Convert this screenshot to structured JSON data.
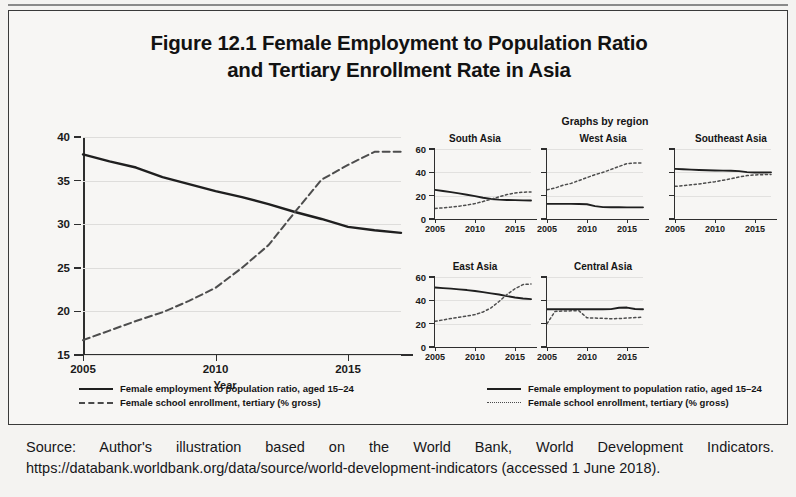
{
  "figure": {
    "title_line1": "Figure 12.1  Female Employment to Population Ratio",
    "title_line2": "and Tertiary Enrollment Rate in Asia"
  },
  "source": {
    "line1": "Source: Author's illustration based on the World Bank, World Development Indicators.",
    "line2": "https://databank.worldbank.org/data/source/world-development-indicators (accessed 1 June 2018)."
  },
  "legend_left": {
    "series": [
      {
        "label": "Female employment to population ratio, aged 15–24",
        "style": "solid"
      },
      {
        "label": "Female school enrollment, tertiary (% gross)",
        "style": "dashed"
      }
    ]
  },
  "legend_right": {
    "series": [
      {
        "label": "Female employment to population ratio, aged 15–24",
        "style": "solid"
      },
      {
        "label": "Female school enrollment, tertiary (% gross)",
        "style": "dotted"
      }
    ]
  },
  "smalls_header": "Graphs by region",
  "axis_titles": {
    "main_x": "Year",
    "smalls_x_left": "Year",
    "smalls_x_right": "Year"
  },
  "chart_data": [
    {
      "id": "main",
      "type": "line",
      "title": "",
      "xlabel": "Year",
      "ylabel": "",
      "xlim": [
        2005,
        2017
      ],
      "ylim": [
        15,
        40
      ],
      "xticks": [
        2005,
        2010,
        2015
      ],
      "yticks": [
        15,
        20,
        25,
        30,
        35,
        40
      ],
      "grid": true,
      "legend_position": "below",
      "x": [
        2005,
        2006,
        2007,
        2008,
        2009,
        2010,
        2011,
        2012,
        2013,
        2014,
        2015,
        2016,
        2017
      ],
      "series": [
        {
          "name": "Female employment to population ratio, aged 15-24",
          "style": "solid",
          "values": [
            38.0,
            37.2,
            36.5,
            35.4,
            34.6,
            33.8,
            33.1,
            32.3,
            31.4,
            30.6,
            29.7,
            29.3,
            29.0
          ]
        },
        {
          "name": "Female school enrollment, tertiary (% gross)",
          "style": "dashed",
          "values": [
            16.7,
            17.8,
            18.9,
            19.9,
            21.2,
            22.7,
            25.0,
            27.6,
            31.4,
            35.1,
            36.8,
            38.3,
            38.3
          ]
        }
      ]
    },
    {
      "id": "south-asia",
      "type": "line",
      "title": "South Asia",
      "xlabel": "Year",
      "ylabel": "",
      "xlim": [
        2005,
        2017
      ],
      "ylim": [
        0,
        60
      ],
      "xticks": [
        2005,
        2010,
        2015
      ],
      "yticks": [
        0,
        20,
        40,
        60
      ],
      "grid": true,
      "x": [
        2005,
        2006,
        2007,
        2008,
        2009,
        2010,
        2011,
        2012,
        2013,
        2014,
        2015,
        2016,
        2017
      ],
      "series": [
        {
          "name": "Female employment to population ratio, aged 15-24",
          "style": "solid",
          "values": [
            25.0,
            24.0,
            23.0,
            22.0,
            20.8,
            19.6,
            18.2,
            17.2,
            16.6,
            16.3,
            16.2,
            16.0,
            15.9
          ]
        },
        {
          "name": "Female school enrollment, tertiary (% gross)",
          "style": "dotted",
          "values": [
            9.0,
            9.6,
            10.2,
            11.0,
            12.0,
            13.2,
            15.0,
            17.0,
            19.0,
            21.0,
            22.3,
            23.0,
            23.2
          ]
        }
      ]
    },
    {
      "id": "west-asia",
      "type": "line",
      "title": "West Asia",
      "xlabel": "Year",
      "ylabel": "",
      "xlim": [
        2005,
        2017
      ],
      "ylim": [
        0,
        60
      ],
      "xticks": [
        2005,
        2010,
        2015
      ],
      "yticks": [
        0,
        20,
        40,
        60
      ],
      "grid": true,
      "x": [
        2005,
        2006,
        2007,
        2008,
        2009,
        2010,
        2011,
        2012,
        2013,
        2014,
        2015,
        2016,
        2017
      ],
      "series": [
        {
          "name": "Female employment to population ratio, aged 15-24",
          "style": "solid",
          "values": [
            13.0,
            13.0,
            13.0,
            13.0,
            12.9,
            12.6,
            11.0,
            10.2,
            10.1,
            10.1,
            10.0,
            10.0,
            10.0
          ]
        },
        {
          "name": "Female school enrollment, tertiary (% gross)",
          "style": "dotted",
          "values": [
            25.0,
            26.5,
            29.0,
            30.5,
            33.0,
            35.5,
            38.0,
            40.0,
            42.5,
            45.0,
            47.5,
            48.0,
            48.0
          ]
        }
      ]
    },
    {
      "id": "southeast-asia",
      "type": "line",
      "title": "Southeast Asia",
      "xlabel": "Year",
      "ylabel": "",
      "xlim": [
        2005,
        2017
      ],
      "ylim": [
        0,
        60
      ],
      "xticks": [
        2005,
        2010,
        2015
      ],
      "yticks": [
        0,
        20,
        40,
        60
      ],
      "grid": true,
      "x": [
        2005,
        2006,
        2007,
        2008,
        2009,
        2010,
        2011,
        2012,
        2013,
        2014,
        2015,
        2016,
        2017
      ],
      "series": [
        {
          "name": "Female employment to population ratio, aged 15-24",
          "style": "solid",
          "values": [
            43.0,
            42.6,
            42.3,
            42.0,
            41.8,
            41.6,
            41.5,
            41.4,
            41.0,
            40.2,
            39.8,
            39.9,
            40.0
          ]
        },
        {
          "name": "Female school enrollment, tertiary (% gross)",
          "style": "dotted",
          "values": [
            28.0,
            28.6,
            29.3,
            30.0,
            31.0,
            32.0,
            33.2,
            34.5,
            36.0,
            37.2,
            37.8,
            38.0,
            38.2
          ]
        }
      ]
    },
    {
      "id": "east-asia",
      "type": "line",
      "title": "East Asia",
      "xlabel": "Year",
      "ylabel": "",
      "xlim": [
        2005,
        2017
      ],
      "ylim": [
        0,
        60
      ],
      "xticks": [
        2005,
        2010,
        2015
      ],
      "yticks": [
        0,
        20,
        40,
        60
      ],
      "grid": true,
      "x": [
        2005,
        2006,
        2007,
        2008,
        2009,
        2010,
        2011,
        2012,
        2013,
        2014,
        2015,
        2016,
        2017
      ],
      "series": [
        {
          "name": "Female employment to population ratio, aged 15-24",
          "style": "solid",
          "values": [
            51.0,
            50.5,
            50.0,
            49.4,
            48.8,
            48.0,
            47.0,
            46.0,
            45.0,
            43.6,
            42.4,
            41.6,
            41.0
          ]
        },
        {
          "name": "Female school enrollment, tertiary (% gross)",
          "style": "dotted",
          "values": [
            22.0,
            23.2,
            24.4,
            25.5,
            26.6,
            27.8,
            30.0,
            33.5,
            39.0,
            45.0,
            50.0,
            53.5,
            54.0
          ]
        }
      ]
    },
    {
      "id": "central-asia",
      "type": "line",
      "title": "Central Asia",
      "xlabel": "Year",
      "ylabel": "",
      "xlim": [
        2005,
        2017
      ],
      "ylim": [
        0,
        60
      ],
      "xticks": [
        2005,
        2010,
        2015
      ],
      "yticks": [
        0,
        20,
        40,
        60
      ],
      "grid": true,
      "x": [
        2005,
        2006,
        2007,
        2008,
        2009,
        2010,
        2011,
        2012,
        2013,
        2014,
        2015,
        2016,
        2017
      ],
      "series": [
        {
          "name": "Female employment to population ratio, aged 15-24",
          "style": "solid",
          "values": [
            32.3,
            32.3,
            32.3,
            32.3,
            32.3,
            32.3,
            32.4,
            32.4,
            32.5,
            33.6,
            33.8,
            32.6,
            32.4
          ]
        },
        {
          "name": "Female school enrollment, tertiary (% gross)",
          "style": "dotted",
          "values": [
            20.0,
            30.5,
            30.8,
            31.0,
            31.0,
            25.0,
            24.8,
            24.6,
            24.2,
            24.4,
            24.8,
            25.2,
            25.6
          ]
        }
      ]
    }
  ]
}
